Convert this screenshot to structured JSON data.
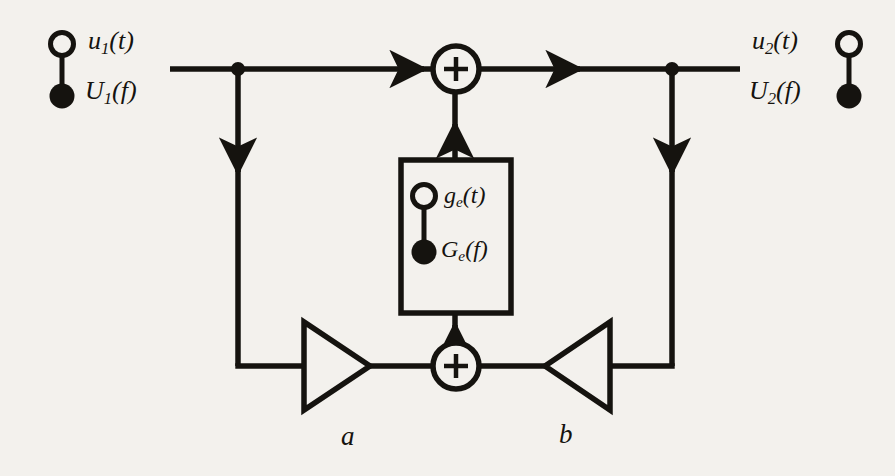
{
  "figure": {
    "background_color": "#f3f1ed",
    "ink_color": "#15130f"
  },
  "terminals": {
    "input": {
      "name": "input-terminal",
      "symbol": "circle-dot-terminal",
      "time_label_base": "u",
      "time_label_sub": "1",
      "time_label_arg": "(t)",
      "freq_label_base": "U",
      "freq_label_sub": "1",
      "freq_label_arg": "(f)"
    },
    "output": {
      "name": "output-terminal",
      "symbol": "circle-dot-terminal",
      "time_label_base": "u",
      "time_label_sub": "2",
      "time_label_arg": "(t)",
      "freq_label_base": "U",
      "freq_label_sub": "2",
      "freq_label_arg": "(f)"
    }
  },
  "block": {
    "name": "impulse-response-block",
    "symbol": "circle-dot-terminal",
    "time_label_base": "g",
    "time_label_sub": "e",
    "time_label_arg": "(t)",
    "freq_label_base": "G",
    "freq_label_sub": "e",
    "freq_label_arg": "(f)"
  },
  "adders": [
    {
      "name": "top-adder",
      "operator": "+"
    },
    {
      "name": "bottom-adder",
      "operator": "+"
    }
  ],
  "gains": [
    {
      "name": "gain-a",
      "label": "a",
      "direction": "right"
    },
    {
      "name": "gain-b",
      "label": "b",
      "direction": "left"
    }
  ],
  "nodes": [
    {
      "name": "input-branch-node"
    },
    {
      "name": "output-branch-node"
    }
  ]
}
